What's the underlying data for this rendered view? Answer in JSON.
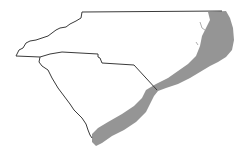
{
  "map": {
    "width": 244,
    "height": 158,
    "background": "#ffffff",
    "outline_color": "#3a3a3a",
    "band_color": "#8f8f8f",
    "regions": [
      {
        "name": "North Carolina"
      },
      {
        "name": "South Carolina"
      }
    ],
    "shaded_band": {
      "description": "coastal band across NC and SC"
    }
  }
}
